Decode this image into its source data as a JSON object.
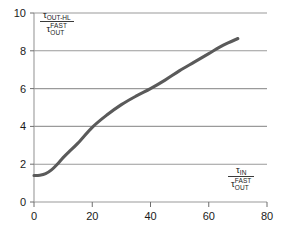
{
  "chart_data": {
    "type": "line",
    "title": "",
    "subtitle": "",
    "xlabel": "τ_IN / τ_OUT^FAST",
    "ylabel": "τ_OUT-HL / τ_OUT^FAST",
    "xlim": [
      0,
      80
    ],
    "ylim": [
      0,
      10
    ],
    "xticks": [
      0,
      20,
      40,
      60,
      80
    ],
    "yticks": [
      0,
      2,
      4,
      6,
      8,
      10
    ],
    "grid": "horizontal",
    "legend": "none",
    "series": [
      {
        "name": "tau_OUT-HL normalized",
        "color": "#5a5a5a",
        "x": [
          0,
          2,
          4,
          6,
          8,
          10,
          12,
          15,
          20,
          25,
          30,
          35,
          40,
          45,
          50,
          55,
          60,
          65,
          70
        ],
        "y": [
          1.4,
          1.42,
          1.5,
          1.7,
          2.0,
          2.35,
          2.65,
          3.1,
          3.95,
          4.6,
          5.15,
          5.6,
          6.0,
          6.45,
          6.95,
          7.4,
          7.85,
          8.3,
          8.65
        ]
      }
    ],
    "annotations": []
  },
  "axes": {
    "y_tick_labels": [
      "0",
      "2",
      "4",
      "6",
      "8",
      "10"
    ],
    "x_tick_labels": [
      "0",
      "20",
      "40",
      "60",
      "80"
    ]
  },
  "ylabel_parts": {
    "num_tau": "τ",
    "num_sub": "OUT-HL",
    "den_tau": "τ",
    "den_sup": "FAST",
    "den_sub": "OUT"
  },
  "xlabel_parts": {
    "num_tau": "τ",
    "num_sub": "IN",
    "den_tau": "τ",
    "den_sup": "FAST",
    "den_sub": "OUT"
  },
  "colors": {
    "curve": "#5a5a5a",
    "grid": "#9a9a9a",
    "text": "#1a1a1a",
    "background": "#ffffff"
  }
}
